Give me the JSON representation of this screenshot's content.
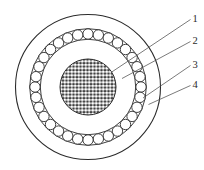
{
  "diagram": {
    "kind": "cable-cross-section",
    "colors": {
      "background": "#ffffff",
      "line": "#2b2b2b",
      "leader": "#4f4f4f",
      "core_gap": "#161616",
      "strand_fill": "#ffffff"
    },
    "armor_wire_count": 32,
    "labels": [
      {
        "text": "1"
      },
      {
        "text": "2"
      },
      {
        "text": "3"
      },
      {
        "text": "4"
      }
    ]
  }
}
